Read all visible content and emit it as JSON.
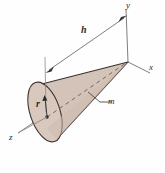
{
  "figure": {
    "background_color": "#fefefe",
    "cone_fill_color": "#d4c3b8",
    "cone_shade_color": "#c9b6a9",
    "outline_color": "#3a3330",
    "axis_color": "#6b6b6b",
    "label_color": "#2b2b2b"
  },
  "axes": [
    {
      "name": "y-axis",
      "label": "y"
    },
    {
      "name": "x-axis",
      "label": "x"
    },
    {
      "name": "z-axis",
      "label": "z"
    }
  ],
  "labels": {
    "y": "y",
    "x": "x",
    "z": "z",
    "height": "h",
    "radius": "r",
    "mass": "m"
  },
  "annotations": [
    {
      "name": "height-dimension",
      "label": "h",
      "kind": "double-arrow-dimension"
    },
    {
      "name": "radius-dimension",
      "label": "r",
      "kind": "arrow-from-center"
    },
    {
      "name": "mass-leader",
      "label": "m",
      "kind": "leader-line"
    }
  ]
}
